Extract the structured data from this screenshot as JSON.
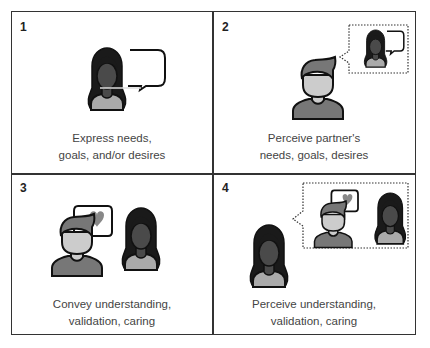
{
  "panels": [
    {
      "number": "1",
      "caption_line1": "Express needs,",
      "caption_line2": "goals, and/or desires"
    },
    {
      "number": "2",
      "caption_line1": "Perceive partner's",
      "caption_line2": "needs, goals, desires"
    },
    {
      "number": "3",
      "caption_line1": "Convey understanding,",
      "caption_line2": "validation, caring"
    },
    {
      "number": "4",
      "caption_line1": "Perceive understanding,",
      "caption_line2": "validation, caring"
    }
  ],
  "colors": {
    "border": "#333333",
    "woman_hair": "#1a1a1a",
    "woman_face": "#4a4a4a",
    "woman_shirt": "#aaaaaa",
    "man_face": "#cccccc",
    "man_hair_shirt": "#777777",
    "heart": "#888888"
  }
}
